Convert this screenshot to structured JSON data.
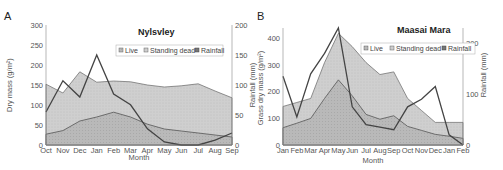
{
  "chart_data": [
    {
      "panel": "A",
      "type": "area",
      "title": "Nylsvley",
      "xlabel": "Month",
      "ylabel": "Dry mass (g/m2)",
      "y2label": "Rainfall (mm)",
      "categories": [
        "Oct",
        "Nov",
        "Dec",
        "Jan",
        "Feb",
        "Mar",
        "Apr",
        "May",
        "Jun",
        "Jul",
        "Aug",
        "Sep"
      ],
      "ylim": [
        0,
        300
      ],
      "yticks": [
        0,
        50,
        100,
        150,
        200,
        250,
        300
      ],
      "y2lim": [
        0,
        200
      ],
      "y2ticks": [
        0,
        50,
        100,
        150,
        200
      ],
      "legend": [
        "Live",
        "Standing dead",
        "Rainfall"
      ],
      "series": [
        {
          "name": "Live",
          "axis": "left",
          "kind": "area",
          "values": [
            27,
            36,
            60,
            70,
            82,
            70,
            52,
            40,
            35,
            30,
            25,
            20
          ]
        },
        {
          "name": "Standing dead",
          "axis": "left",
          "kind": "area",
          "note": "cumulative top boundary",
          "values": [
            152,
            130,
            183,
            157,
            160,
            158,
            150,
            145,
            148,
            153,
            135,
            118
          ]
        },
        {
          "name": "Rainfall",
          "axis": "right",
          "kind": "line",
          "values": [
            55,
            107,
            80,
            150,
            85,
            67,
            27,
            5,
            0,
            0,
            8,
            20
          ]
        }
      ]
    },
    {
      "panel": "B",
      "type": "area",
      "title": "Maasai Mara",
      "xlabel": "Month",
      "ylabel": "Grass dry mass (g/m2)",
      "y2label": "Rainfall (mm)",
      "categories": [
        "Jan",
        "Feb",
        "Mar",
        "Apr",
        "May",
        "Jun",
        "Jul",
        "Aug",
        "Sep",
        "Oct",
        "Nov",
        "Dec",
        "Jan",
        "Feb"
      ],
      "ylim": [
        0,
        440
      ],
      "yticks": [
        0,
        100,
        200,
        300,
        400
      ],
      "y2lim": [
        0,
        230
      ],
      "y2ticks": [
        0,
        100,
        200
      ],
      "legend": [
        "Live",
        "Standing dead",
        "Rainfall"
      ],
      "series": [
        {
          "name": "Live",
          "axis": "left",
          "kind": "area",
          "values": [
            65,
            82,
            100,
            175,
            245,
            185,
            115,
            97,
            110,
            70,
            55,
            40,
            33,
            25
          ]
        },
        {
          "name": "Standing dead",
          "axis": "left",
          "kind": "area",
          "note": "cumulative top boundary",
          "values": [
            145,
            160,
            175,
            310,
            420,
            370,
            310,
            265,
            275,
            175,
            130,
            85,
            85,
            85
          ]
        },
        {
          "name": "Rainfall",
          "axis": "right",
          "kind": "line",
          "values": [
            135,
            55,
            140,
            180,
            230,
            75,
            40,
            35,
            30,
            75,
            90,
            115,
            20,
            0
          ]
        }
      ]
    }
  ],
  "labels": {
    "panelA": "A",
    "panelB": "B",
    "titleA": "Nylsvley",
    "titleB": "Maasai Mara",
    "xlabel": "Month",
    "ylabelA": "Dry mass (g/m²)",
    "ylabelB": "Grass dry mass (g/m²)",
    "y2label": "Rainfall (mm)",
    "legend_live": "Live",
    "legend_dead": "Standing dead",
    "legend_rain": "Rainfall"
  },
  "colors": {
    "dead_fill": "#c9c9c9",
    "live_fill": "#b3b3b3",
    "line": "#555555",
    "rain_line": "#444444",
    "axis": "#888888"
  }
}
